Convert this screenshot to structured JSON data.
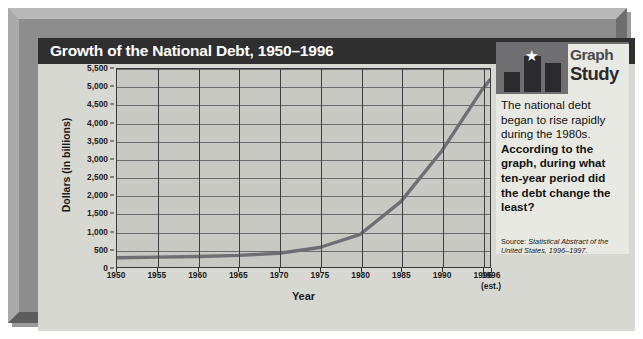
{
  "title": "Growth of the National Debt, 1950–1996",
  "panel": {
    "logo_line1": "Graph",
    "logo_line2": "Study",
    "star_glyph": "★",
    "text_plain_1": "The national debt began to rise rapidly during the 1980s. ",
    "text_bold": "According to the graph, during what ten-year period did the debt change the least?",
    "source_prefix": "Source: ",
    "source_italic": "Statistical Abstract of the United States, 1996–1997."
  },
  "colors": {
    "frame": "#8d8d8d",
    "title_bar": "#2f2f2f",
    "plot_bg": "#c9c9c4",
    "curve": "#6e6e74",
    "panel_bg": "#e9e9e4",
    "logo_bg": "#6f6f72"
  },
  "chart_data": {
    "type": "line",
    "title": "Growth of the National Debt, 1950–1996",
    "xlabel": "Year",
    "ylabel": "Dollars (in billions)",
    "ylim": [
      0,
      5500
    ],
    "xlim": [
      1950,
      1996
    ],
    "grid": true,
    "legend": null,
    "ytick_labels": [
      "5,500",
      "5,000",
      "4,500",
      "4,000",
      "3,500",
      "3,000",
      "2,500",
      "2,000",
      "1,500",
      "1,000",
      "500",
      "0"
    ],
    "ytick_values": [
      5500,
      5000,
      4500,
      4000,
      3500,
      3000,
      2500,
      2000,
      1500,
      1000,
      500,
      0
    ],
    "xtick_labels": [
      "1950",
      "1955",
      "1960",
      "1965",
      "1970",
      "1975",
      "1980",
      "1985",
      "1990",
      "1995",
      "1996"
    ],
    "xtick_values": [
      1950,
      1955,
      1960,
      1965,
      1970,
      1975,
      1980,
      1985,
      1990,
      1995,
      1996
    ],
    "xtick_note": "(est.)",
    "xtick_note_at": 1996,
    "series": [
      {
        "name": "National debt",
        "x": [
          1950,
          1955,
          1960,
          1965,
          1970,
          1975,
          1980,
          1985,
          1990,
          1995,
          1996
        ],
        "values": [
          257,
          274,
          291,
          323,
          381,
          542,
          909,
          1817,
          3207,
          4921,
          5200
        ]
      }
    ]
  }
}
